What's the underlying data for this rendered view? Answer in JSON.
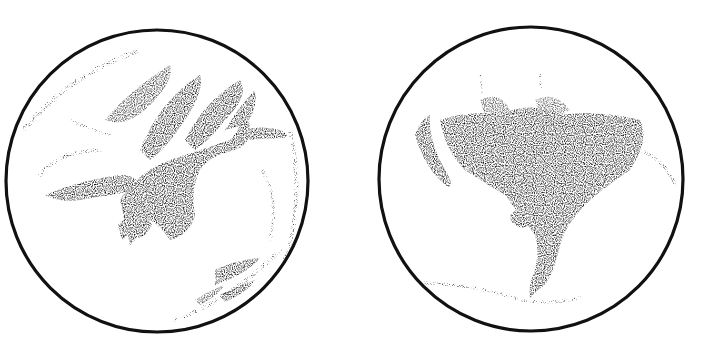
{
  "image": {
    "description": "Two circular stippled ink drawings of a planetary disk (Mars-like) side by side on white background",
    "background": "#ffffff",
    "ink": "#111111"
  },
  "disks": [
    {
      "id": "left",
      "cx": 157,
      "cy": 181,
      "r": 151,
      "features": "large dark branching stippled marking spreading from upper right across center, with dark lobes at lower center and a stippled streak at lower right"
    },
    {
      "id": "right",
      "cx": 531,
      "cy": 179,
      "r": 152,
      "features": "fan-shaped dark stippled marking across upper middle narrowing into a stem descending to the bottom, with a small dark spot to the left of the stem and a faint curved line near the bottom"
    }
  ]
}
